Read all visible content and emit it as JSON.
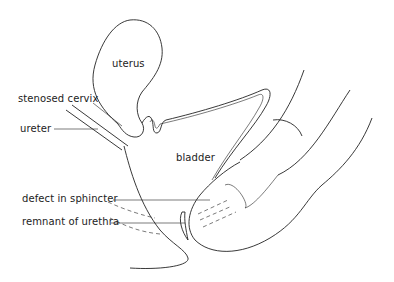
{
  "diagram": {
    "type": "anatomical line drawing",
    "labels": {
      "uterus": "uterus",
      "stenosed_cervix": "stenosed cervix",
      "ureter": "ureter",
      "bladder": "bladder",
      "defect_in_sphincter": "defect in sphincter",
      "remnant_of_urethra": "remnant of urethra"
    },
    "colors": {
      "line": "#222222",
      "background": "#ffffff"
    }
  }
}
